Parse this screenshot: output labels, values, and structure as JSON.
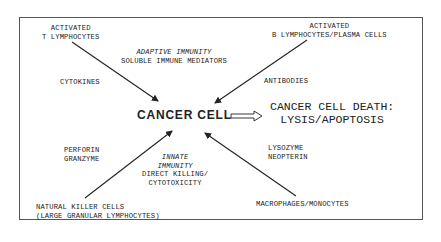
{
  "diagram": {
    "center": {
      "label": "CANCER CELL"
    },
    "outcome": {
      "line1": "CANCER CELL DEATH:",
      "line2": "LYSIS/APOPTOSIS"
    },
    "nodes": {
      "top_left": {
        "line1": "ACTIVATED",
        "line2": "T LYMPHOCYTES",
        "mediator": "CYTOKINES"
      },
      "top_right": {
        "line1": "ACTIVATED",
        "line2": "B LYMPHOCYTES/PLASMA CELLS",
        "mediator": "ANTIBODIES"
      },
      "bottom_left": {
        "line1": "NATURAL KILLER CELLS",
        "line2": "(LARGE GRANULAR LYMPHOCYTES)",
        "mediator_line1": "PERFORIN",
        "mediator_line2": "GRANZYME"
      },
      "bottom_right": {
        "line1": "MACROPHAGES/MONOCYTES",
        "mediator_line1": "LYSOZYME",
        "mediator_line2": "NEOPTERIN"
      }
    },
    "adaptive": {
      "title": "ADAPTIVE IMMUNITY",
      "subtitle": "SOLUBLE IMMUNE MEDIATORS"
    },
    "innate": {
      "title_line1": "INNATE",
      "title_line2": "IMMUNITY",
      "sub_line1": "DIRECT KILLING/",
      "sub_line2": "CYTOTOXICITY"
    },
    "colors": {
      "line": "#222222",
      "frame": "#555555",
      "background": "#ffffff"
    }
  }
}
